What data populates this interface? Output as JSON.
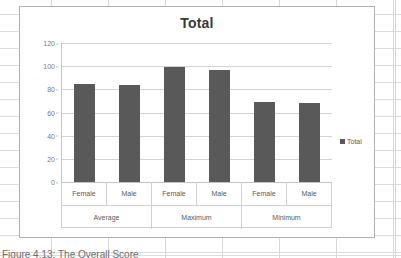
{
  "chart_object": {
    "title": "Total",
    "legend_label": "Total",
    "legend_marker": "square-marker"
  },
  "caption": {
    "text": "Figure 4.13: The Overall Score"
  },
  "colors": {
    "bar": "#595959",
    "gridline": "#d3d3d3",
    "axis": "#c4c4c4",
    "title_text": "#3a3a3a",
    "tick_text": "#7a7a7a",
    "frame_border": "#b0b0b0"
  },
  "chart_data": {
    "type": "bar",
    "title": "Total",
    "xlabel": "",
    "ylabel": "",
    "ylim": [
      0,
      120
    ],
    "yticks": [
      0,
      20,
      40,
      60,
      80,
      100,
      120
    ],
    "ytick_labels": [
      "0",
      "20",
      "40",
      "60",
      "80",
      "100",
      "120"
    ],
    "grid": true,
    "legend_position": "right",
    "series": [
      {
        "name": "Total",
        "values": [
          85,
          84,
          99,
          97,
          69,
          68
        ]
      }
    ],
    "categories": [
      "Female",
      "Male",
      "Female",
      "Male",
      "Female",
      "Male"
    ],
    "group_labels": [
      "Average",
      "Maximum",
      "Minimum"
    ],
    "groups": [
      {
        "label": "Average",
        "bars": [
          {
            "label": "Female",
            "value": 85
          },
          {
            "label": "Male",
            "value": 84
          }
        ]
      },
      {
        "label": "Maximum",
        "bars": [
          {
            "label": "Female",
            "value": 99
          },
          {
            "label": "Male",
            "value": 97
          }
        ]
      },
      {
        "label": "Minimum",
        "bars": [
          {
            "label": "Female",
            "value": 69
          },
          {
            "label": "Male",
            "value": 68
          }
        ]
      }
    ]
  }
}
